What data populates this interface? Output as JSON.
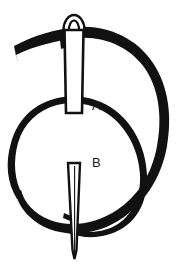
{
  "figure": {
    "type": "line-drawing",
    "background_color": "#ffffff",
    "ink_color": "#111111",
    "width": 177,
    "height": 268,
    "labels": [
      {
        "id": "A",
        "text": "A",
        "x": 92,
        "y": 99,
        "refers_to": "needle shaft above eye-exit / upper needle section"
      },
      {
        "id": "B",
        "text": "B",
        "x": 92,
        "y": 156,
        "refers_to": "needle point section below the thread loop"
      }
    ],
    "parts": {
      "needle_eye": "loop at top of needle",
      "needle_shaft": "tapered rectangular body ending at label A",
      "needle_point": "sharp tapering tip starting at label B",
      "thread": "double-line loop passing through the eye and around"
    }
  }
}
